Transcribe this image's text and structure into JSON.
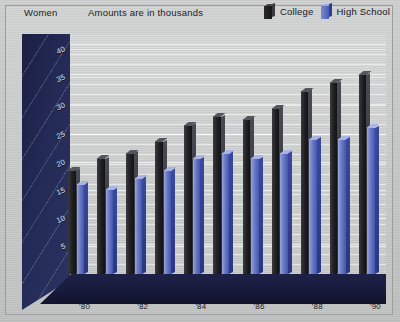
{
  "header": {
    "category_label": "Women",
    "units_note": "Amounts are in thousands"
  },
  "legend": {
    "position": "top-right",
    "items": [
      {
        "label": "College",
        "color": "#232327",
        "icon": "book-swatch-dark-icon"
      },
      {
        "label": "High School",
        "color": "#4356ad",
        "icon": "book-swatch-blue-icon"
      }
    ]
  },
  "axes": {
    "y_ticks": [
      "5",
      "10",
      "15",
      "20",
      "25",
      "30",
      "35",
      "40"
    ],
    "x_ticks_visible": [
      "'80",
      "'82",
      "'84",
      "'86",
      "'88",
      "'90"
    ]
  },
  "chart_data": {
    "type": "bar",
    "title": "Women",
    "subtitle": "Amounts are in thousands",
    "xlabel": "",
    "ylabel": "",
    "ylim": [
      0,
      42
    ],
    "ytick_step": 5,
    "grid": true,
    "legend_position": "top-right",
    "categories": [
      "'80",
      "'81",
      "'82",
      "'83",
      "'84",
      "'85",
      "'86",
      "'87",
      "'88",
      "'89",
      "'90"
    ],
    "tick_labels_shown": [
      "'80",
      "",
      "'82",
      "",
      "'84",
      "",
      "'86",
      "",
      "'88",
      "",
      "'90"
    ],
    "series": [
      {
        "name": "College",
        "color": "#232327",
        "values": [
          18.5,
          20.5,
          21.5,
          23.5,
          26.5,
          28.0,
          27.5,
          29.5,
          32.5,
          34.0,
          35.5
        ]
      },
      {
        "name": "High School",
        "color": "#4356ad",
        "values": [
          16.0,
          15.0,
          17.0,
          18.5,
          20.5,
          21.5,
          20.5,
          21.5,
          24.0,
          24.0,
          26.0
        ]
      }
    ]
  }
}
